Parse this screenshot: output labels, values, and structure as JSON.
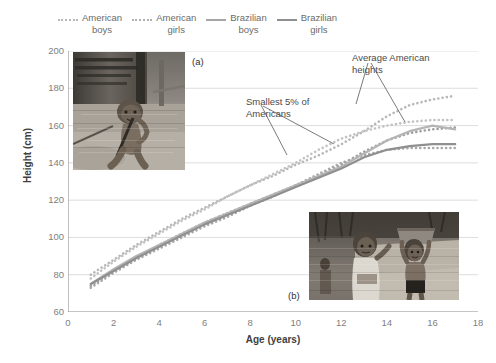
{
  "figure": {
    "panel_tags": [
      "(a)",
      "(b)"
    ]
  },
  "legend": {
    "position": "top",
    "items": [
      {
        "label_line1": "American",
        "label_line2": "boys",
        "style": "dotted",
        "color": "#b8b8b8"
      },
      {
        "label_line1": "American",
        "label_line2": "girls",
        "style": "dotted",
        "color": "#b0b0b0"
      },
      {
        "label_line1": "Brazilian",
        "label_line2": "boys",
        "style": "solid",
        "color": "#a6a6a6"
      },
      {
        "label_line1": "Brazilian",
        "label_line2": "girls",
        "style": "solid",
        "color": "#8f8f8f"
      }
    ]
  },
  "annotations": [
    {
      "id": "smallest",
      "text": "Smallest 5% of Americans"
    },
    {
      "id": "average",
      "text": "Average American heights"
    }
  ],
  "photos": [
    {
      "id": "photo-a",
      "caption": "(a)",
      "alt": "Child squatting beside a wooden stilt house on bare earth"
    },
    {
      "id": "photo-b",
      "caption": "(b)",
      "alt": "Two children outdoors, one balancing a basin on the head"
    }
  ],
  "chart_data": {
    "type": "line",
    "title": "",
    "xlabel": "Age (years)",
    "ylabel": "Height (cm)",
    "xlim": [
      0,
      18
    ],
    "ylim": [
      60,
      200
    ],
    "xticks": [
      0,
      2,
      4,
      6,
      8,
      10,
      12,
      14,
      16,
      18
    ],
    "yticks": [
      60,
      80,
      100,
      120,
      140,
      160,
      180,
      200
    ],
    "grid": "horizontal",
    "legend_position": "top",
    "x": [
      1,
      2,
      3,
      4,
      5,
      6,
      7,
      8,
      9,
      10,
      11,
      12,
      13,
      14,
      15,
      16,
      17
    ],
    "series": [
      {
        "name": "American boys",
        "role": "average",
        "style": "dotted",
        "color": "#b8b8b8",
        "values": [
          80,
          88,
          96,
          103,
          110,
          116,
          122,
          128,
          133,
          139,
          144,
          150,
          157,
          165,
          171,
          174,
          176
        ]
      },
      {
        "name": "American girls",
        "role": "average",
        "style": "dotted",
        "color": "#c2c2c2",
        "values": [
          78,
          87,
          95,
          102,
          109,
          115,
          122,
          128,
          134,
          140,
          147,
          153,
          157,
          160,
          162,
          163,
          163
        ]
      },
      {
        "name": "American boys",
        "role": "smallest 5%",
        "style": "dotted",
        "color": "#9e9e9e",
        "values": [
          74,
          82,
          89,
          96,
          102,
          108,
          113,
          118,
          123,
          128,
          133,
          139,
          146,
          152,
          156,
          158,
          159
        ]
      },
      {
        "name": "American girls",
        "role": "smallest 5%",
        "style": "dotted",
        "color": "#a8a8a8",
        "values": [
          73,
          81,
          88,
          94,
          100,
          106,
          111,
          117,
          122,
          128,
          134,
          140,
          144,
          147,
          148,
          148,
          148
        ]
      },
      {
        "name": "Brazilian boys",
        "role": "observed",
        "style": "solid",
        "color": "#b5b5b5",
        "values": [
          75,
          83,
          90,
          96,
          102,
          108,
          113,
          118,
          123,
          128,
          133,
          138,
          145,
          152,
          157,
          160,
          158
        ]
      },
      {
        "name": "Brazilian girls",
        "role": "observed",
        "style": "solid",
        "color": "#8f8f8f",
        "values": [
          75,
          82,
          89,
          95,
          101,
          107,
          112,
          117,
          122,
          127,
          132,
          137,
          143,
          147,
          149,
          150,
          150
        ]
      }
    ]
  }
}
